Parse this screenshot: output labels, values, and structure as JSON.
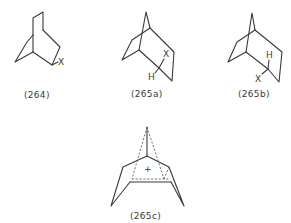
{
  "figure": {
    "structures": [
      {
        "id": "264",
        "label": "(264)",
        "atoms": [
          "X"
        ]
      },
      {
        "id": "265a",
        "label": "(265a)",
        "atoms": [
          "X",
          "H"
        ]
      },
      {
        "id": "265b",
        "label": "(265b)",
        "atoms": [
          "H",
          "X"
        ]
      },
      {
        "id": "265c",
        "label": "(265c)",
        "atoms": [
          "+"
        ]
      }
    ]
  }
}
